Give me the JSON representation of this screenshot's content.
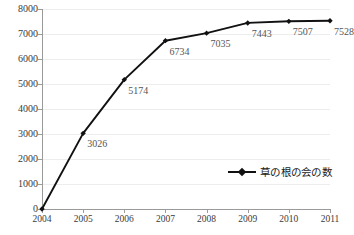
{
  "chart_data": {
    "type": "line",
    "title": "",
    "subtitle": "",
    "xlabel": "",
    "ylabel": "",
    "categories": [
      "2004",
      "2005",
      "2006",
      "2007",
      "2008",
      "2009",
      "2010",
      "2011"
    ],
    "series": [
      {
        "name": "草の根の会の数",
        "values": [
          0,
          3026,
          5174,
          6734,
          7035,
          7443,
          7507,
          7528
        ],
        "point_labels": [
          "",
          "3026",
          "5174",
          "6734",
          "7035",
          "7443",
          "7507",
          "7528"
        ],
        "color": "#111111",
        "marker": "diamond"
      }
    ],
    "ylim": [
      0,
      8000
    ],
    "yticks": [
      "0",
      "1000",
      "2000",
      "3000",
      "4000",
      "5000",
      "6000",
      "7000",
      "8000"
    ],
    "ytick_values": [
      0,
      1000,
      2000,
      3000,
      4000,
      5000,
      6000,
      7000,
      8000
    ],
    "grid": true,
    "grid_axis": "y",
    "grid_color": "#ededed",
    "legend": {
      "position": "inside-bottom-right",
      "entries": [
        "草の根の会の数"
      ]
    },
    "axis_color": "#9a9a9a",
    "datalabel_color": "#555555",
    "background": "#ffffff"
  },
  "legend": {
    "label": "草の根の会の数",
    "symbol": "line-marker-icon"
  }
}
